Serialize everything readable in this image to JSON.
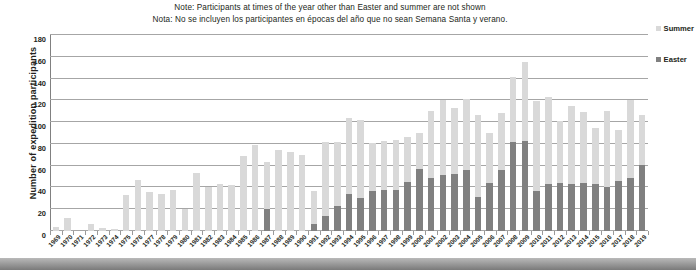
{
  "notes": {
    "en": "Note: Participants at times of the year other than Easter and summer are not shown",
    "es": "Nota: No se incluyen los participantes en épocas del año que no sean Semana Santa y verano."
  },
  "legend": {
    "position": "right",
    "items": [
      {
        "label": "Summer",
        "color": "#d9d9d9"
      },
      {
        "label": "Easter",
        "color": "#808080"
      }
    ]
  },
  "colors": {
    "summer": "#d9d9d9",
    "easter": "#808080",
    "grid": "#a6a6a6",
    "text": "#231f20"
  },
  "chart_data": {
    "type": "bar",
    "title": "",
    "xlabel": "",
    "ylabel": "Number of expedition participants",
    "ylim": [
      0,
      180
    ],
    "ytick_step": 20,
    "yticks": [
      0,
      20,
      40,
      60,
      80,
      100,
      120,
      140,
      160,
      180
    ],
    "grid": true,
    "stacked": false,
    "legend_position": "right",
    "categories": [
      "1969",
      "1970",
      "1971",
      "1972",
      "1973",
      "1974",
      "1975",
      "1976",
      "1977",
      "1978",
      "1979",
      "1980",
      "1981",
      "1982",
      "1983",
      "1984",
      "1985",
      "1986",
      "1987",
      "1988",
      "1989",
      "1990",
      "1991",
      "1992",
      "1993",
      "1994",
      "1995",
      "1996",
      "1997",
      "1998",
      "1999",
      "2000",
      "2001",
      "2002",
      "2003",
      "2004",
      "2005",
      "2006",
      "2007",
      "2008",
      "2009",
      "2010",
      "2011",
      "2012",
      "2013",
      "2014",
      "2015",
      "2016",
      "2017",
      "2018",
      "2019"
    ],
    "series": [
      {
        "name": "Summer",
        "color": "#d9d9d9",
        "values": [
          4,
          12,
          0,
          6,
          3,
          2,
          33,
          47,
          36,
          34,
          38,
          20,
          53,
          40,
          43,
          42,
          69,
          79,
          63,
          74,
          73,
          70,
          37,
          82,
          82,
          104,
          102,
          81,
          83,
          84,
          86,
          90,
          110,
          120,
          113,
          121,
          107,
          90,
          108,
          141,
          155,
          119,
          123,
          101,
          115,
          109,
          95,
          110,
          93,
          120,
          107
        ]
      },
      {
        "name": "Easter",
        "color": "#808080",
        "values": [
          0,
          0,
          0,
          0,
          0,
          0,
          0,
          0,
          0,
          0,
          0,
          0,
          0,
          0,
          0,
          0,
          0,
          0,
          20,
          0,
          0,
          0,
          6,
          14,
          23,
          34,
          30,
          37,
          38,
          38,
          45,
          57,
          49,
          51,
          52,
          56,
          31,
          44,
          56,
          82,
          83,
          37,
          43,
          44,
          43,
          44,
          43,
          40,
          46,
          49,
          61
        ]
      }
    ]
  }
}
